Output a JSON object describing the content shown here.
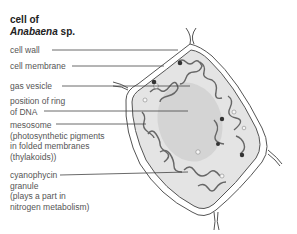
{
  "title": {
    "line1": "cell of",
    "genus": "Anabaena",
    "species": " sp."
  },
  "labels": [
    {
      "id": "cell-wall",
      "lines": [
        "cell wall"
      ]
    },
    {
      "id": "cell-membrane",
      "lines": [
        "cell membrane"
      ]
    },
    {
      "id": "gas-vesicle",
      "lines": [
        "gas vesicle"
      ]
    },
    {
      "id": "dna-ring",
      "lines": [
        "position of ring",
        "of DNA"
      ]
    },
    {
      "id": "mesosome",
      "lines": [
        "mesosome",
        "(photosynthetic pigments",
        "in folded membranes",
        "(thylakoids))"
      ]
    },
    {
      "id": "cyanophycin",
      "lines": [
        "cyanophycin",
        "granule",
        "(plays a part in",
        "nitrogen metabolism)"
      ]
    }
  ],
  "colors": {
    "outline": "#555555",
    "cytoplasm": "#e4e4e4",
    "nucleoid": "#d2d2d2",
    "leader": "#444444",
    "granule": "#333333"
  }
}
